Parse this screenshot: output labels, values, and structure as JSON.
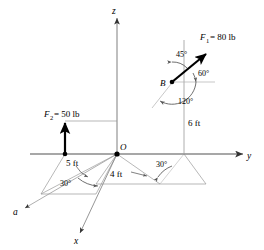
{
  "figure": {
    "type": "engineering-statics-diagram",
    "background_color": "#ffffff",
    "line_color": "#808080",
    "vector_color": "#000000"
  },
  "axes": [
    {
      "name": "z-axis",
      "label": "z",
      "direction": "up"
    },
    {
      "name": "y-axis",
      "label": "y",
      "direction": "right"
    },
    {
      "name": "x-axis",
      "label": "x",
      "direction": "lower-left-to-lower-right"
    },
    {
      "name": "a-axis",
      "label": "a",
      "direction": "lower-left"
    }
  ],
  "points": [
    {
      "name": "origin",
      "label": "O"
    },
    {
      "name": "point-b",
      "label": "B"
    }
  ],
  "forces": [
    {
      "name": "force-f1",
      "label": "F",
      "subscript": "1",
      "equals": "= 80 lb",
      "full": "F1 = 80 lb",
      "magnitude": 80,
      "unit": "lb",
      "applied_at": "B"
    },
    {
      "name": "force-f2",
      "label": "F",
      "subscript": "2",
      "equals": "= 50 lb",
      "full": "F2 = 50 lb",
      "magnitude": 50,
      "unit": "lb",
      "direction": "vertical-up"
    }
  ],
  "angles": [
    {
      "name": "angle-45",
      "value": "45",
      "unit": "deg",
      "text": "45°",
      "location": "at-B-upper-left"
    },
    {
      "name": "angle-60",
      "value": "60",
      "unit": "deg",
      "text": "60°",
      "location": "at-B-right-of-vector"
    },
    {
      "name": "angle-120",
      "value": "120",
      "unit": "deg",
      "text": "120°",
      "location": "below-B"
    },
    {
      "name": "angle-30-right",
      "value": "30",
      "unit": "deg",
      "text": "30°",
      "location": "base-plane-right-of-origin"
    },
    {
      "name": "angle-30-left",
      "value": "30",
      "unit": "deg",
      "text": "30°",
      "location": "base-plane-left-of-origin"
    }
  ],
  "dimensions": [
    {
      "name": "dim-5ft",
      "value": "5",
      "unit": "ft",
      "text": "5 ft",
      "location": "left-of-origin-along-a"
    },
    {
      "name": "dim-4ft",
      "value": "4",
      "unit": "ft",
      "text": "4 ft",
      "location": "right-of-origin-base-plane"
    },
    {
      "name": "dim-6ft",
      "value": "6",
      "unit": "ft",
      "text": "6 ft",
      "location": "vertical-below-B"
    }
  ]
}
